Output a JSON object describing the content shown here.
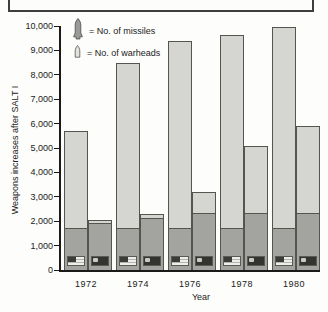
{
  "caption_box": {
    "text": ""
  },
  "chart_data": {
    "type": "bar",
    "title": "",
    "ylabel": "Weapons increases after SALT I",
    "xlabel": "Year",
    "ylim": [
      0,
      10000
    ],
    "grid": "off",
    "legend_position": "top-left-inside",
    "legend": [
      {
        "icon": "missile-icon",
        "label": "= No. of missiles"
      },
      {
        "icon": "warhead-icon",
        "label": "= No. of warheads"
      }
    ],
    "categories": [
      "1972",
      "1974",
      "1976",
      "1978",
      "1980"
    ],
    "bar_structure": "Each year has two stacked bars: left = USA (US flag), right = USSR (Soviet flag). Dark lower segment = No. of missiles; full (light) bar height = No. of warheads.",
    "groups": [
      {
        "year": "1972",
        "us": {
          "missiles": 1700,
          "warheads": 5700
        },
        "ussr": {
          "missiles": 1900,
          "warheads": 2050
        }
      },
      {
        "year": "1974",
        "us": {
          "missiles": 1700,
          "warheads": 8500
        },
        "ussr": {
          "missiles": 2100,
          "warheads": 2300
        }
      },
      {
        "year": "1976",
        "us": {
          "missiles": 1700,
          "warheads": 9400
        },
        "ussr": {
          "missiles": 2300,
          "warheads": 3200
        }
      },
      {
        "year": "1978",
        "us": {
          "missiles": 1700,
          "warheads": 9650
        },
        "ussr": {
          "missiles": 2300,
          "warheads": 5100
        }
      },
      {
        "year": "1980",
        "us": {
          "missiles": 1700,
          "warheads": 9950
        },
        "ussr": {
          "missiles": 2300,
          "warheads": 5900
        }
      }
    ],
    "y_ticks": [
      {
        "label": "10,000",
        "value": 10000
      },
      {
        "label": "9,000",
        "value": 9000
      },
      {
        "label": "8,000",
        "value": 8000
      },
      {
        "label": "7,000",
        "value": 7000
      },
      {
        "label": "6,000",
        "value": 6000
      },
      {
        "label": "5,000",
        "value": 5000
      },
      {
        "label": "4,000",
        "value": 4000
      },
      {
        "label": "3,000",
        "value": 3000
      },
      {
        "label": "2,000",
        "value": 2000
      },
      {
        "label": "1,000",
        "value": 1000
      },
      {
        "label": "0",
        "value": 0
      }
    ]
  },
  "colors": {
    "bar_light": "#d5d5d2",
    "bar_dark": "#a3a39f",
    "bar_border": "#55554f",
    "axis": "#1a1a1a",
    "background": "#fdfdfb",
    "us_flag_canton": "#3b3b38",
    "ussr_flag": "#33332f"
  }
}
